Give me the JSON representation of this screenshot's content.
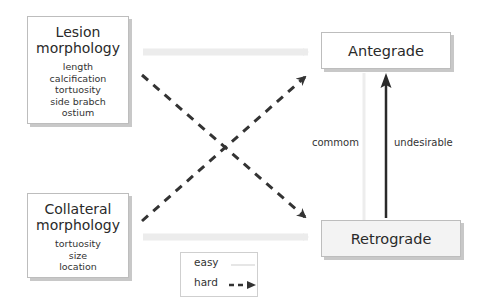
{
  "boxes": {
    "lesion": {
      "title_line1": "Lesion",
      "title_line2": "morphology",
      "items": [
        "length",
        "calcification",
        "tortuosity",
        "side brabch",
        "ostium"
      ]
    },
    "collateral": {
      "title_line1": "Collateral",
      "title_line2": "morphology",
      "items": [
        "tortuosity",
        "size",
        "location"
      ]
    },
    "antegrade": {
      "label": "Antegrade"
    },
    "retrograde": {
      "label": "Retrograde"
    }
  },
  "edge_labels": {
    "common": "commom",
    "undesirable": "undesirable"
  },
  "legend": {
    "easy": "easy",
    "hard": "hard"
  },
  "colors": {
    "easy_arrow": "#ebebeb",
    "hard_arrow": "#333333",
    "solid_arrow": "#2a2a2a",
    "box_border": "#bdbdbd",
    "box_shadow": "#c8c8c8"
  }
}
